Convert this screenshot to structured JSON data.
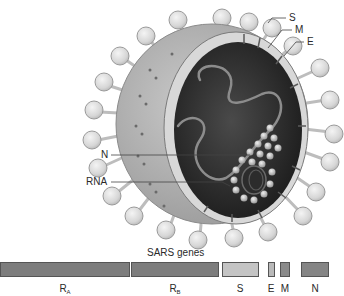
{
  "figure": {
    "virion_labels": [
      {
        "id": "S",
        "text": "S"
      },
      {
        "id": "M",
        "text": "M"
      },
      {
        "id": "E",
        "text": "E"
      },
      {
        "id": "N",
        "text": "N"
      },
      {
        "id": "RNA",
        "text": "RNA"
      }
    ],
    "genes_title": "SARS genes",
    "genes": [
      {
        "name": "R",
        "sub": "A",
        "x": 0,
        "width": 130,
        "color": "#7d7d7d"
      },
      {
        "name": "R",
        "sub": "B",
        "x": 131,
        "width": 88,
        "color": "#7d7d7d"
      },
      {
        "name": "S",
        "sub": "",
        "x": 222,
        "width": 37,
        "color": "#c4c4c4"
      },
      {
        "name": "E",
        "sub": "",
        "x": 268,
        "width": 7,
        "color": "#b9b9b9"
      },
      {
        "name": "M",
        "sub": "",
        "x": 280,
        "width": 10,
        "color": "#8a8a8a"
      },
      {
        "name": "N",
        "sub": "",
        "x": 301,
        "width": 28,
        "color": "#858585"
      }
    ]
  }
}
